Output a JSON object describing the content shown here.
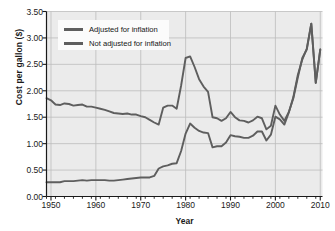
{
  "chart_data": {
    "type": "line",
    "title": "",
    "xlabel": "Year",
    "ylabel": "Cost per gallon ($)",
    "xlim": [
      1949,
      2010.5
    ],
    "ylim": [
      0.0,
      3.5
    ],
    "grid": true,
    "legend_position": "upper left",
    "yticks": [
      "0.00",
      "0.50",
      "1.00",
      "1.50",
      "2.00",
      "2.50",
      "3.00",
      "3.50"
    ],
    "ytick_values": [
      0.0,
      0.5,
      1.0,
      1.5,
      2.0,
      2.5,
      3.0,
      3.5
    ],
    "xticks": [
      "1950",
      "1960",
      "1970",
      "1980",
      "1990",
      "2000",
      "2010"
    ],
    "xtick_values": [
      1950,
      1960,
      1970,
      1980,
      1990,
      2000,
      2010
    ],
    "x_minor_tick_step": 2,
    "line_color": "#5e5e5e",
    "plot_background": "#ebebeb",
    "grid_color": "#bdbdbd",
    "series": [
      {
        "name": "Adjusted for inflation",
        "x": [
          1949,
          1950,
          1951,
          1952,
          1953,
          1954,
          1955,
          1956,
          1957,
          1958,
          1959,
          1960,
          1961,
          1962,
          1963,
          1964,
          1965,
          1966,
          1967,
          1968,
          1969,
          1970,
          1971,
          1972,
          1973,
          1974,
          1975,
          1976,
          1977,
          1978,
          1979,
          1980,
          1981,
          1982,
          1983,
          1984,
          1985,
          1986,
          1987,
          1988,
          1989,
          1990,
          1991,
          1992,
          1993,
          1994,
          1995,
          1996,
          1997,
          1998,
          1999,
          2000,
          2001,
          2002,
          2003,
          2004,
          2005,
          2006,
          2007,
          2008,
          2009,
          2010
        ],
        "values": [
          1.86,
          1.82,
          1.74,
          1.73,
          1.76,
          1.75,
          1.72,
          1.73,
          1.74,
          1.7,
          1.7,
          1.68,
          1.66,
          1.64,
          1.61,
          1.58,
          1.57,
          1.56,
          1.57,
          1.55,
          1.55,
          1.52,
          1.5,
          1.45,
          1.4,
          1.36,
          1.68,
          1.72,
          1.72,
          1.66,
          2.1,
          2.62,
          2.65,
          2.45,
          2.22,
          2.08,
          1.98,
          1.5,
          1.48,
          1.43,
          1.48,
          1.6,
          1.5,
          1.44,
          1.43,
          1.4,
          1.44,
          1.51,
          1.48,
          1.27,
          1.34,
          1.72,
          1.55,
          1.43,
          1.6,
          1.86,
          2.25,
          2.62,
          2.78,
          3.27,
          2.15,
          2.78
        ]
      },
      {
        "name": "Not adjusted for inflation",
        "x": [
          1949,
          1950,
          1951,
          1952,
          1953,
          1954,
          1955,
          1956,
          1957,
          1958,
          1959,
          1960,
          1961,
          1962,
          1963,
          1964,
          1965,
          1966,
          1967,
          1968,
          1969,
          1970,
          1971,
          1972,
          1973,
          1974,
          1975,
          1976,
          1977,
          1978,
          1979,
          1980,
          1981,
          1982,
          1983,
          1984,
          1985,
          1986,
          1987,
          1988,
          1989,
          1990,
          1991,
          1992,
          1993,
          1994,
          1995,
          1996,
          1997,
          1998,
          1999,
          2000,
          2001,
          2002,
          2003,
          2004,
          2005,
          2006,
          2007,
          2008,
          2009,
          2010
        ],
        "values": [
          0.27,
          0.27,
          0.27,
          0.27,
          0.29,
          0.29,
          0.29,
          0.3,
          0.31,
          0.3,
          0.31,
          0.31,
          0.31,
          0.31,
          0.3,
          0.3,
          0.31,
          0.32,
          0.33,
          0.34,
          0.35,
          0.36,
          0.36,
          0.36,
          0.39,
          0.53,
          0.57,
          0.59,
          0.62,
          0.63,
          0.86,
          1.19,
          1.38,
          1.3,
          1.24,
          1.21,
          1.2,
          0.93,
          0.95,
          0.95,
          1.02,
          1.16,
          1.14,
          1.13,
          1.11,
          1.11,
          1.15,
          1.23,
          1.23,
          1.06,
          1.17,
          1.51,
          1.46,
          1.36,
          1.59,
          1.88,
          2.3,
          2.59,
          2.8,
          3.27,
          2.15,
          2.78
        ]
      }
    ]
  },
  "legend": {
    "items": [
      {
        "label": "Adjusted for inflation"
      },
      {
        "label": "Not adjusted for inflation"
      }
    ]
  }
}
